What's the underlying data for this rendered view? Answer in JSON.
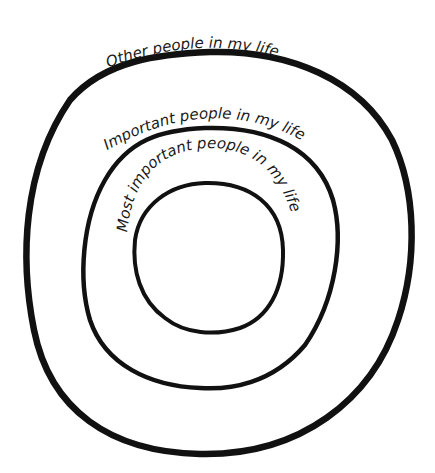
{
  "diagram": {
    "type": "concentric-circles",
    "rings": [
      {
        "id": "outer",
        "label": "Other people in my life"
      },
      {
        "id": "middle",
        "label": "Important people in my life"
      },
      {
        "id": "inner",
        "label": "Most important people in my life"
      }
    ]
  },
  "colors": {
    "stroke": "#111111",
    "background": "#ffffff",
    "text": "#1a1a1a"
  }
}
